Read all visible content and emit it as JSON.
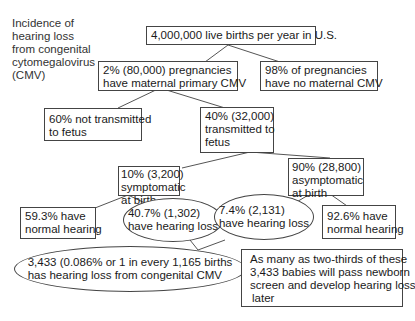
{
  "title": [
    "Incidence of",
    "hearing loss",
    "from congenital",
    "cytomegalovirus",
    "(CMV)"
  ],
  "nodes": {
    "root": [
      "4,000,000 live births per year in U.S."
    ],
    "primary_cmv": [
      "2% (80,000) pregnancies",
      "have maternal primary CMV"
    ],
    "no_cmv": [
      "98% of pregnancies",
      "have no maternal CMV"
    ],
    "not_transmitted": [
      "60% not transmitted",
      "to fetus"
    ],
    "transmitted": [
      "40% (32,000)",
      "transmitted to",
      "fetus"
    ],
    "symptomatic": [
      "10% (3,200)",
      "symptomatic",
      "at birth"
    ],
    "asymptomatic": [
      "90% (28,800)",
      "asymptomatic",
      "at birth"
    ],
    "sym_normal": [
      "59.3% have",
      "normal hearing"
    ],
    "sym_loss": [
      "40.7% (1,302)",
      "have hearing loss"
    ],
    "asym_loss": [
      "7.4% (2,131)",
      "have hearing loss"
    ],
    "asym_normal": [
      "92.6% have",
      "normal hearing"
    ],
    "total": [
      "3,433 (0.086% or 1 in every 1,165 births",
      "has hearing loss from congenital CMV"
    ],
    "note": [
      "As many as two-thirds of these",
      "3,433 babies will pass newborn",
      "screen and develop hearing loss",
      "later"
    ]
  }
}
